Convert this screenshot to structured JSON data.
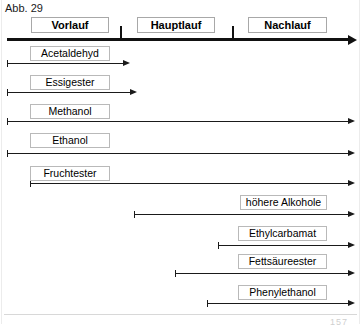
{
  "figure": {
    "caption": "Abb. 29",
    "folio": "157"
  },
  "axis": {
    "name": "distillation-timeline",
    "start_x": 7,
    "end_x": 348,
    "y": 39,
    "ticks": [
      120,
      232
    ]
  },
  "phases": [
    {
      "label": "Vorlauf",
      "x": 31,
      "width": 78,
      "y": 17
    },
    {
      "label": "Hauptlauf",
      "x": 137,
      "width": 78,
      "y": 17
    },
    {
      "label": "Nachlauf",
      "x": 248,
      "width": 79,
      "y": 17
    }
  ],
  "compounds": [
    {
      "label": "Acetaldehyd",
      "label_x": 30,
      "label_width": 80,
      "label_y": 46,
      "arrow_start": 7,
      "arrow_end": 123,
      "arrow_y": 63
    },
    {
      "label": "Essigester",
      "label_x": 30,
      "label_width": 80,
      "label_y": 75,
      "arrow_start": 7,
      "arrow_end": 130,
      "arrow_y": 92
    },
    {
      "label": "Methanol",
      "label_x": 30,
      "label_width": 80,
      "label_y": 104,
      "arrow_start": 7,
      "arrow_end": 348,
      "arrow_y": 121
    },
    {
      "label": "Ethanol",
      "label_x": 30,
      "label_width": 80,
      "label_y": 133,
      "arrow_start": 7,
      "arrow_end": 348,
      "arrow_y": 153
    },
    {
      "label": "Fruchtester",
      "label_x": 30,
      "label_width": 80,
      "label_y": 166,
      "arrow_start": 30,
      "arrow_end": 348,
      "arrow_y": 183
    },
    {
      "label": "höhere Alkohole",
      "label_x": 240,
      "label_width": 87,
      "label_y": 195,
      "arrow_start": 134,
      "arrow_end": 348,
      "arrow_y": 214
    },
    {
      "label": "Ethylcarbamat",
      "label_x": 238,
      "label_width": 89,
      "label_y": 226,
      "arrow_start": 218,
      "arrow_end": 348,
      "arrow_y": 245
    },
    {
      "label": "Fettsäureester",
      "label_x": 238,
      "label_width": 89,
      "label_y": 254,
      "arrow_start": 175,
      "arrow_end": 348,
      "arrow_y": 273
    },
    {
      "label": "Phenylethanol",
      "label_x": 238,
      "label_width": 89,
      "label_y": 285,
      "arrow_start": 207,
      "arrow_end": 348,
      "arrow_y": 303
    }
  ],
  "colors": {
    "ink": "#111111",
    "box_border": "#b9b9b9",
    "background": "#ffffff"
  }
}
